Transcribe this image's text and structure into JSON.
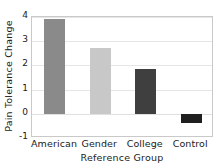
{
  "chart_data": {
    "type": "bar",
    "title": "",
    "xlabel": "Reference Group",
    "ylabel": "Pain Tolerance Change",
    "categories": [
      "American",
      "Gender",
      "College",
      "Control"
    ],
    "values": [
      3.92,
      2.73,
      1.87,
      -0.38
    ],
    "series": [
      {
        "name": "Pain Tolerance Change",
        "values": [
          3.92,
          2.73,
          1.87,
          -0.38
        ]
      }
    ],
    "bar_colors": [
      "#8a8a8a",
      "#c8c8c8",
      "#3f3f3f",
      "#1f1f1f"
    ],
    "ylim": [
      -1,
      4
    ],
    "yticks": [
      4,
      3,
      2,
      1,
      0,
      -1
    ],
    "ytick_labels": [
      "4",
      "3",
      "2",
      "1",
      "0",
      "-1"
    ],
    "grid": true,
    "grid_axis": "y",
    "legend": "none",
    "frame_color": "#c9c9c9",
    "gridline_color": "#e6e6e6",
    "background": "#ffffff"
  },
  "axes": {
    "y_title": "Pain Tolerance Change",
    "x_title": "Reference Group"
  }
}
